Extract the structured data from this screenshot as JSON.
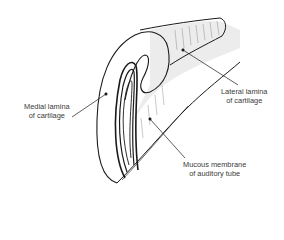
{
  "diagram": {
    "labels": [
      {
        "id": "medial",
        "line1": "Medial lamina",
        "line2": "of cartilage"
      },
      {
        "id": "lateral",
        "line1": "Lateral lamina",
        "line2": "of cartilage"
      },
      {
        "id": "mucous",
        "line1": "Mucous membrane",
        "line2": "of auditory tube"
      }
    ],
    "colors": {
      "ink": "#1a1a1a",
      "shade": "#e6e6e6",
      "text": "#3a3a3a"
    }
  }
}
